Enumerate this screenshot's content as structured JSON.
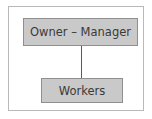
{
  "diagram": {
    "type": "org-chart",
    "nodes": [
      {
        "id": "owner-manager",
        "label": "Owner – Manager"
      },
      {
        "id": "workers",
        "label": "Workers"
      }
    ],
    "edges": [
      {
        "from": "owner-manager",
        "to": "workers"
      }
    ]
  }
}
